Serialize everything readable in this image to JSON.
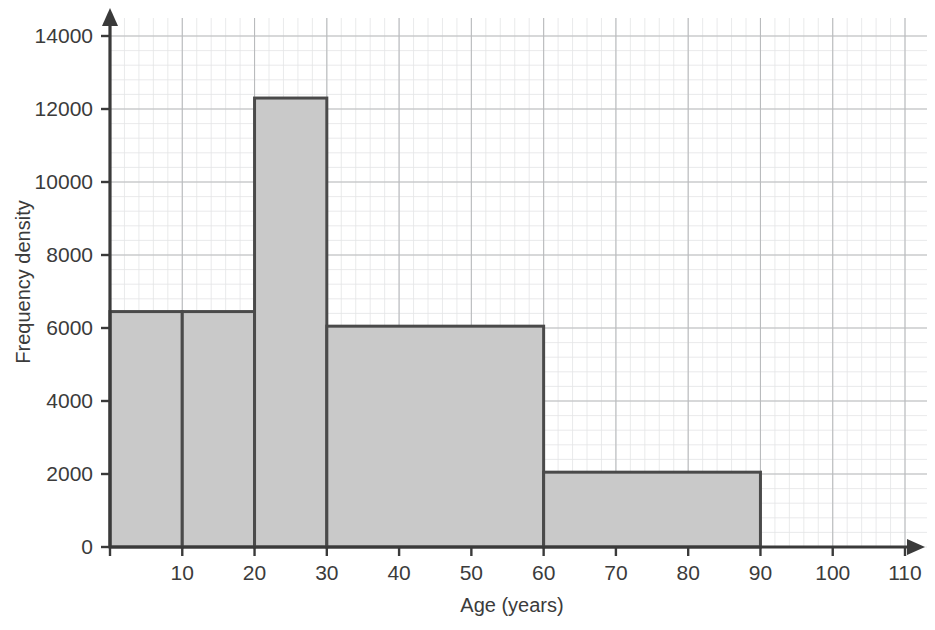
{
  "chart_data": {
    "type": "bar",
    "title": "",
    "xlabel": "Age (years)",
    "ylabel": "Frequency density",
    "xlim": [
      0,
      110
    ],
    "ylim": [
      0,
      14000
    ],
    "grid": true,
    "legend": "none",
    "x_ticks": [
      10,
      20,
      30,
      40,
      50,
      60,
      70,
      80,
      90,
      100,
      110
    ],
    "x_tick_labels": [
      "10",
      "20",
      "30",
      "40",
      "50",
      "60",
      "70",
      "80",
      "90",
      "100",
      "110"
    ],
    "y_ticks": [
      0,
      2000,
      4000,
      6000,
      8000,
      10000,
      12000,
      14000
    ],
    "y_tick_labels": [
      "0",
      "2000",
      "4000",
      "6000",
      "8000",
      "10000",
      "12000",
      "14000"
    ],
    "bin_edges": [
      0,
      10,
      20,
      30,
      60,
      90
    ],
    "bars": [
      {
        "x0": 0,
        "x1": 10,
        "height": 6450,
        "label": "0-10"
      },
      {
        "x0": 10,
        "x1": 20,
        "height": 6450,
        "label": "10-20"
      },
      {
        "x0": 20,
        "x1": 30,
        "height": 12300,
        "label": "20-30"
      },
      {
        "x0": 30,
        "x1": 60,
        "height": 6050,
        "label": "30-60"
      },
      {
        "x0": 60,
        "x1": 90,
        "height": 2050,
        "label": "60-90"
      }
    ],
    "colors": {
      "bar_fill": "#c9c9c9",
      "bar_stroke": "#4a4a4a",
      "axis": "#3a3a3a",
      "grid_major": "#b9bbbd",
      "grid_minor": "#e3e4e6",
      "text": "#3b3b3b",
      "background": "#ffffff"
    }
  }
}
